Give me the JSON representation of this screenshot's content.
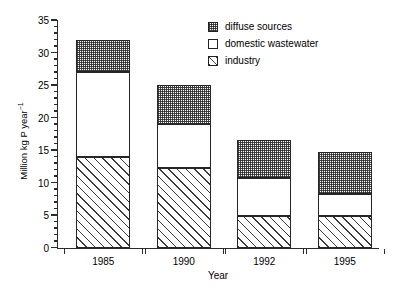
{
  "chart_data": {
    "type": "bar",
    "variant": "stacked",
    "title": "",
    "xlabel": "Year",
    "ylabel": "Million kg P year⁻¹",
    "categories": [
      "1985",
      "1990",
      "1992",
      "1995"
    ],
    "series": [
      {
        "name": "industry",
        "values": [
          14.0,
          12.2,
          4.8,
          4.8
        ]
      },
      {
        "name": "domestic wastewater",
        "values": [
          13.0,
          6.8,
          5.9,
          3.4
        ]
      },
      {
        "name": "diffuse sources",
        "values": [
          5.0,
          6.0,
          5.9,
          6.5
        ]
      }
    ],
    "totals": [
      32.0,
      25.0,
      16.6,
      14.7
    ],
    "ylim": [
      0,
      35
    ],
    "ytick_major": [
      0,
      5,
      10,
      15,
      20,
      25,
      30,
      35
    ],
    "ytick_minor_step": 1,
    "grid": false,
    "legend_position": "top-right"
  },
  "axes": {
    "y": {
      "label_prefix": "Million kg P year",
      "label_exponent": "−1",
      "ticks": [
        {
          "value": 35,
          "label": "35"
        },
        {
          "value": 30,
          "label": "30"
        },
        {
          "value": 25,
          "label": "25"
        },
        {
          "value": 20,
          "label": "20"
        },
        {
          "value": 15,
          "label": "15"
        },
        {
          "value": 10,
          "label": "10"
        },
        {
          "value": 5,
          "label": "5"
        },
        {
          "value": 0,
          "label": "0"
        }
      ]
    },
    "x": {
      "label": "Year",
      "ticks": [
        {
          "label": "1985"
        },
        {
          "label": "1990"
        },
        {
          "label": "1992"
        },
        {
          "label": "1995"
        }
      ]
    }
  },
  "legend": {
    "items": [
      {
        "label": "diffuse sources",
        "pattern": "stipple-dots",
        "swatch_name": "legend-swatch-diffuse-sources"
      },
      {
        "label": "domestic wastewater",
        "pattern": "solid-white",
        "swatch_name": "legend-swatch-domestic-wastewater"
      },
      {
        "label": "industry",
        "pattern": "diagonal-hatch",
        "swatch_name": "legend-swatch-industry"
      }
    ]
  },
  "colors": {
    "axis": "#2b2b2b",
    "bar_outline": "#262626",
    "background": "#ffffff",
    "hatch": "#3a3a3a",
    "stipple": "#282828"
  }
}
